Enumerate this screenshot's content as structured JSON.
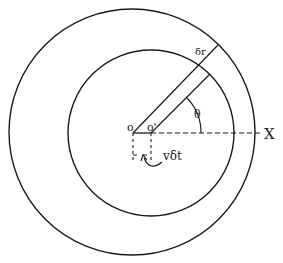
{
  "diagram": {
    "labels": {
      "origin": "o",
      "shifted_origin": "o'",
      "x_axis": "X",
      "angle": "θ",
      "strip_width": "δr",
      "displacement": "vδt"
    },
    "colors": {
      "stroke": "#1a1a1a",
      "background": "#ffffff"
    },
    "geometry": {
      "outer_circle": {
        "cx": 132,
        "cy": 132,
        "r": 123
      },
      "inner_circle": {
        "cx": 151,
        "cy": 133,
        "r": 83
      },
      "O": {
        "x": 133,
        "y": 133
      },
      "O_prime": {
        "x": 151,
        "y": 133
      }
    }
  }
}
